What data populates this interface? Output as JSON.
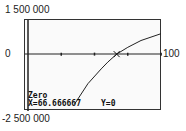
{
  "chart_data": {
    "type": "line",
    "title": "",
    "xlabel": "",
    "ylabel": "",
    "xlim": [
      0,
      100
    ],
    "ylim": [
      -2500000,
      1500000
    ],
    "x_tick_step": 25,
    "grid": false,
    "labels": {
      "y_max": "1 500 000",
      "y_min": "-2 500 000",
      "x_origin_label": "0",
      "x_max": "100"
    },
    "series": [
      {
        "name": "f(x)",
        "x": [
          35,
          45,
          55,
          60,
          66.666667,
          75,
          85,
          100
        ],
        "y": [
          -2200000,
          -1300000,
          -650000,
          -350000,
          0,
          300000,
          600000,
          900000
        ]
      }
    ],
    "annotation": {
      "mode": "Zero",
      "x_text": "X=66.666667",
      "y_text": "Y=0",
      "x": 66.666667,
      "y": 0
    }
  }
}
